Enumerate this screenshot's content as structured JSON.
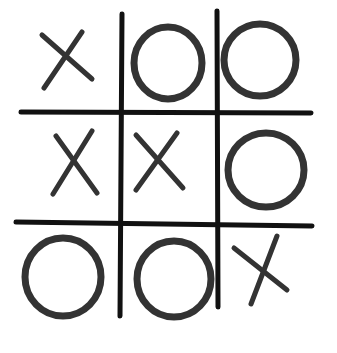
{
  "title": "Tic-tac-toe board (hand drawn)",
  "colors": {
    "background": "#ffffff",
    "grid": "#111111",
    "marks": "#333333"
  },
  "board": {
    "rows": [
      [
        "X",
        "O",
        "O"
      ],
      [
        "X",
        "X",
        "O"
      ],
      [
        "O",
        "O",
        "X"
      ]
    ]
  },
  "grid_lines": [
    {
      "id": "vertical-line-1",
      "x1": 122,
      "y1": 14,
      "x2": 120,
      "y2": 316
    },
    {
      "id": "vertical-line-2",
      "x1": 217,
      "y1": 11,
      "x2": 218,
      "y2": 307
    },
    {
      "id": "horizontal-line-1",
      "x1": 21,
      "y1": 112,
      "x2": 311,
      "y2": 113
    },
    {
      "id": "horizontal-line-2",
      "x1": 16,
      "y1": 222,
      "x2": 312,
      "y2": 226
    }
  ],
  "marks": [
    {
      "row": 0,
      "col": 0,
      "symbol": "X",
      "strokes": [
        [
          42,
          35,
          92,
          79
        ],
        [
          82,
          32,
          44,
          88
        ]
      ]
    },
    {
      "row": 0,
      "col": 1,
      "symbol": "O",
      "cx": 168,
      "cy": 63,
      "rx": 34,
      "ry": 36
    },
    {
      "row": 0,
      "col": 2,
      "symbol": "O",
      "cx": 260,
      "cy": 60,
      "rx": 36,
      "ry": 36
    },
    {
      "row": 1,
      "col": 0,
      "symbol": "X",
      "strokes": [
        [
          56,
          136,
          97,
          193
        ],
        [
          92,
          131,
          53,
          194
        ]
      ]
    },
    {
      "row": 1,
      "col": 1,
      "symbol": "X",
      "strokes": [
        [
          136,
          135,
          183,
          188
        ],
        [
          177,
          133,
          136,
          190
        ]
      ]
    },
    {
      "row": 1,
      "col": 2,
      "symbol": "O",
      "cx": 266,
      "cy": 170,
      "rx": 38,
      "ry": 37
    },
    {
      "row": 2,
      "col": 0,
      "symbol": "O",
      "cx": 63,
      "cy": 277,
      "rx": 38,
      "ry": 39
    },
    {
      "row": 2,
      "col": 1,
      "symbol": "O",
      "cx": 174,
      "cy": 279,
      "rx": 37,
      "ry": 38
    },
    {
      "row": 2,
      "col": 2,
      "symbol": "X",
      "strokes": [
        [
          234,
          248,
          287,
          290
        ],
        [
          277,
          236,
          251,
          304
        ]
      ]
    }
  ]
}
